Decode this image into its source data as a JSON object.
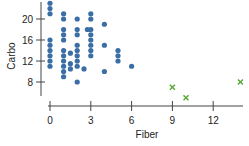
{
  "chart_data": {
    "type": "scatter",
    "title": "",
    "xlabel": "Fiber",
    "ylabel": "Carbo",
    "xlim": [
      -0.5,
      14.5
    ],
    "ylim": [
      5,
      23
    ],
    "xticks": [
      0,
      3,
      6,
      9,
      12
    ],
    "yticks": [
      8,
      12,
      16,
      20
    ],
    "grid": false,
    "legend": null,
    "colors": {
      "main": "#3b6ea5",
      "outlier": "#5aa83c",
      "axis": "#444444"
    },
    "series": [
      {
        "name": "main",
        "marker": "circle",
        "points": [
          [
            0,
            23
          ],
          [
            0,
            22
          ],
          [
            0,
            21
          ],
          [
            0,
            16
          ],
          [
            0,
            15
          ],
          [
            0,
            14
          ],
          [
            0,
            13
          ],
          [
            0,
            12
          ],
          [
            0,
            11
          ],
          [
            1,
            21
          ],
          [
            1,
            20
          ],
          [
            1,
            18
          ],
          [
            1,
            17
          ],
          [
            1,
            16
          ],
          [
            1,
            14
          ],
          [
            1,
            13
          ],
          [
            1,
            12
          ],
          [
            1,
            11
          ],
          [
            1,
            10
          ],
          [
            1,
            9
          ],
          [
            1.5,
            13.5
          ],
          [
            1.5,
            11.5
          ],
          [
            1.5,
            10.5
          ],
          [
            2,
            20
          ],
          [
            2,
            18
          ],
          [
            2,
            17
          ],
          [
            2,
            15
          ],
          [
            2,
            14
          ],
          [
            2,
            13
          ],
          [
            2,
            12
          ],
          [
            2,
            11
          ],
          [
            2,
            8
          ],
          [
            2.5,
            10.5
          ],
          [
            2.75,
            18
          ],
          [
            3,
            21
          ],
          [
            3,
            20
          ],
          [
            3,
            18
          ],
          [
            3,
            17
          ],
          [
            3,
            16
          ],
          [
            3,
            15
          ],
          [
            3,
            14
          ],
          [
            3,
            13
          ],
          [
            4,
            19
          ],
          [
            4,
            15
          ],
          [
            4,
            10
          ],
          [
            5,
            14
          ],
          [
            5,
            13
          ],
          [
            5,
            12
          ],
          [
            6,
            11
          ]
        ]
      },
      {
        "name": "outliers",
        "marker": "x",
        "points": [
          [
            9,
            7
          ],
          [
            10,
            5
          ],
          [
            14,
            8
          ]
        ]
      }
    ]
  }
}
